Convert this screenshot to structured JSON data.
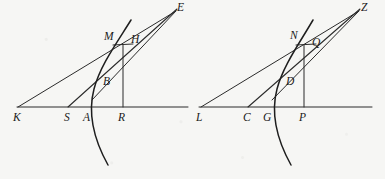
{
  "figure": {
    "background_color": "#f6f6f4",
    "ink_color": "#2b2b2b",
    "canvas": {
      "width": 385,
      "height": 179
    }
  },
  "diagrams": [
    {
      "id": "left-diagram",
      "name": "left-figure",
      "baseline": {
        "name": "baseline-KR",
        "x1": 17,
        "y1": 107,
        "x2": 188,
        "y2": 107,
        "width": 1
      },
      "curve": {
        "name": "conic-arc-left",
        "path": "M 131 20 C 116 44 100 66 94 89 C 88 112 93 138 108 165",
        "width": 1.5
      },
      "lines": [
        {
          "name": "line-K-to-E",
          "x1": 18,
          "y1": 107,
          "x2": 176,
          "y2": 11,
          "width": 1
        },
        {
          "name": "line-S-to-E",
          "x1": 68,
          "y1": 107,
          "x2": 177,
          "y2": 9,
          "width": 1.1
        },
        {
          "name": "line-A-to-E",
          "x1": 92,
          "y1": 100,
          "x2": 176,
          "y2": 11,
          "width": 1
        },
        {
          "name": "vertical-R-to-M",
          "x1": 123,
          "y1": 107,
          "x2": 123,
          "y2": 45,
          "width": 1
        },
        {
          "name": "tangent-M-to-H",
          "x1": 113,
          "y1": 45,
          "x2": 133,
          "y2": 44,
          "width": 1
        }
      ],
      "labels": [
        {
          "name": "label-K",
          "text": "K",
          "x": 13,
          "y": 118,
          "anchor": "start"
        },
        {
          "name": "label-S",
          "text": "S",
          "x": 64,
          "y": 118,
          "anchor": "start"
        },
        {
          "name": "label-A",
          "text": "A",
          "x": 83,
          "y": 118,
          "anchor": "start"
        },
        {
          "name": "label-R",
          "text": "R",
          "x": 118,
          "y": 118,
          "anchor": "start"
        },
        {
          "name": "label-B",
          "text": "B",
          "x": 103,
          "y": 82,
          "anchor": "start"
        },
        {
          "name": "label-M",
          "text": "M",
          "x": 104,
          "y": 37,
          "anchor": "start"
        },
        {
          "name": "label-H",
          "text": "H",
          "x": 131,
          "y": 40,
          "anchor": "start"
        },
        {
          "name": "label-E",
          "text": "E",
          "x": 177,
          "y": 8,
          "anchor": "start"
        }
      ]
    },
    {
      "id": "right-diagram",
      "name": "right-figure",
      "baseline": {
        "name": "baseline-LP",
        "x1": 199,
        "y1": 107,
        "x2": 372,
        "y2": 107,
        "width": 1
      },
      "curve": {
        "name": "conic-arc-right",
        "path": "M 313 20 C 299 44 283 66 277 89 C 271 112 276 138 291 165",
        "width": 1.5
      },
      "lines": [
        {
          "name": "line-L-to-Z",
          "x1": 201,
          "y1": 107,
          "x2": 359,
          "y2": 11,
          "width": 1
        },
        {
          "name": "line-C-to-Z",
          "x1": 248,
          "y1": 107,
          "x2": 360,
          "y2": 9,
          "width": 1.1
        },
        {
          "name": "line-G-to-Z",
          "x1": 272,
          "y1": 100,
          "x2": 359,
          "y2": 11,
          "width": 1
        },
        {
          "name": "vertical-P-to-N",
          "x1": 304,
          "y1": 107,
          "x2": 304,
          "y2": 45,
          "width": 1
        },
        {
          "name": "tangent-N-to-Q",
          "x1": 296,
          "y1": 45,
          "x2": 316,
          "y2": 44,
          "width": 1
        }
      ],
      "labels": [
        {
          "name": "label-L",
          "text": "L",
          "x": 196,
          "y": 118,
          "anchor": "start"
        },
        {
          "name": "label-C",
          "text": "C",
          "x": 243,
          "y": 118,
          "anchor": "start"
        },
        {
          "name": "label-G",
          "text": "G",
          "x": 263,
          "y": 118,
          "anchor": "start"
        },
        {
          "name": "label-P",
          "text": "P",
          "x": 299,
          "y": 118,
          "anchor": "start"
        },
        {
          "name": "label-D",
          "text": "D",
          "x": 286,
          "y": 82,
          "anchor": "start"
        },
        {
          "name": "label-N",
          "text": "N",
          "x": 290,
          "y": 36,
          "anchor": "start"
        },
        {
          "name": "label-Q",
          "text": "Q",
          "x": 312,
          "y": 43,
          "anchor": "start"
        },
        {
          "name": "label-Z",
          "text": "Z",
          "x": 361,
          "y": 8,
          "anchor": "start"
        }
      ]
    }
  ]
}
